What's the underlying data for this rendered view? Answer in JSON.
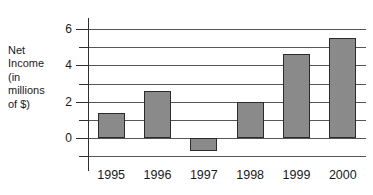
{
  "chart_data": {
    "type": "bar",
    "title": "",
    "subtitle": "",
    "xlabel": "",
    "ylabel": "Net Income (in millions of $)",
    "ylabel_lines": [
      "Net",
      "Income",
      "(in",
      "millions",
      "of $)"
    ],
    "categories": [
      "1995",
      "1996",
      "1997",
      "1998",
      "1999",
      "2000"
    ],
    "values": [
      1.4,
      2.6,
      -0.7,
      2.0,
      4.65,
      5.5
    ],
    "ylim": [
      -1,
      6
    ],
    "ytick_labels": [
      "0",
      "2",
      "4",
      "6"
    ],
    "ytick_values": [
      0,
      2,
      4,
      6
    ],
    "minor_tick_values": [
      -1,
      1,
      3,
      5
    ],
    "gridline_values": [
      -1,
      0,
      1,
      2,
      3,
      4,
      5,
      6
    ],
    "grid": true,
    "legend": false,
    "legend_position": "none",
    "bar_color": "#8a8a8a",
    "bar_edge_color": "#2b2b2b",
    "axis_color": "#303030",
    "grid_color": "#555555",
    "background_color": "#ffffff"
  }
}
